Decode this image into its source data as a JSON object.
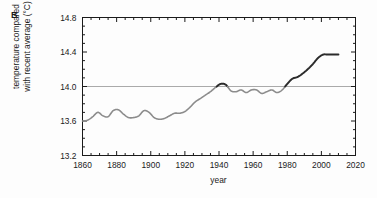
{
  "figure": {
    "panel_label": "B",
    "background_color": "#fdfdfd"
  },
  "chart_data": {
    "type": "line",
    "title": "",
    "subtitle": "",
    "panel": "B",
    "xlabel": "year",
    "ylabel": "temperature compared with recent average (°C)",
    "ylabel_line1": "temperature compared",
    "ylabel_line2": "with recent average (°C)",
    "xlim": [
      1860,
      2020
    ],
    "ylim": [
      13.2,
      14.8
    ],
    "x_ticks": [
      1860,
      1880,
      1900,
      1920,
      1940,
      1960,
      1980,
      2000,
      2020
    ],
    "x_tick_labels": [
      "1860",
      "1880",
      "1900",
      "1920",
      "1940",
      "1960",
      "1980",
      "2000",
      "2020"
    ],
    "y_ticks": [
      13.2,
      13.6,
      14.0,
      14.4,
      14.8
    ],
    "y_tick_labels": [
      "13.2",
      "13.6",
      "14.0",
      "14.4",
      "14.8"
    ],
    "x_minor_step": 5,
    "y_minor_step": 0.1,
    "grid": false,
    "legend": null,
    "reference_line": {
      "axis": "y",
      "value": 14.0,
      "color": "#aaaaaa",
      "label": ""
    },
    "line_color_below": "#8c8c8c",
    "line_color_above": "#2b2b2b",
    "line_width": 1.6,
    "series": [
      {
        "name": "global mean temperature",
        "color": "#8c8c8c",
        "x": [
          1860,
          1863,
          1866,
          1869,
          1872,
          1875,
          1878,
          1881,
          1884,
          1887,
          1890,
          1893,
          1896,
          1899,
          1902,
          1905,
          1908,
          1911,
          1914,
          1917,
          1920,
          1923,
          1926,
          1929,
          1932,
          1935,
          1938,
          1941,
          1944,
          1947,
          1950,
          1953,
          1956,
          1959,
          1962,
          1965,
          1968,
          1971,
          1974,
          1977,
          1980,
          1983,
          1986,
          1989,
          1992,
          1995,
          1998,
          2001,
          2004,
          2007,
          2010
        ],
        "values": [
          13.6,
          13.61,
          13.65,
          13.7,
          13.66,
          13.65,
          13.72,
          13.73,
          13.68,
          13.64,
          13.64,
          13.66,
          13.72,
          13.7,
          13.64,
          13.62,
          13.63,
          13.66,
          13.69,
          13.69,
          13.71,
          13.76,
          13.82,
          13.86,
          13.9,
          13.94,
          13.99,
          14.03,
          14.02,
          13.95,
          13.94,
          13.96,
          13.93,
          13.96,
          13.96,
          13.92,
          13.94,
          13.96,
          13.93,
          13.96,
          14.03,
          14.09,
          14.11,
          14.15,
          14.2,
          14.26,
          14.33,
          14.37,
          14.37,
          14.37,
          14.37
        ]
      }
    ],
    "annotations": [
      {
        "text": "Values above the 14.0 °C reference line are drawn in a darker shade.",
        "visible": false
      }
    ]
  },
  "axes": {
    "x_axis_name": "year",
    "y_axis_name": "temperature compared with recent average (°C)"
  }
}
